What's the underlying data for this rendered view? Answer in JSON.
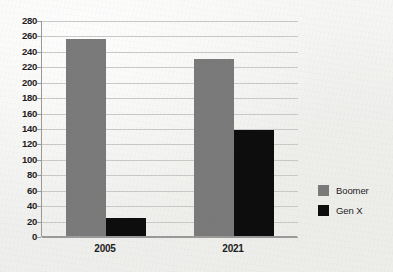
{
  "chart_data": {
    "type": "bar",
    "title": "",
    "subtitle": "",
    "xlabel": "",
    "ylabel": "",
    "categories": [
      "2005",
      "2021"
    ],
    "series": [
      {
        "name": "Boomer",
        "color": "#7a7a7a",
        "values": [
          255,
          230
        ]
      },
      {
        "name": "Gen X",
        "color": "#0d0d0d",
        "values": [
          24,
          138
        ]
      }
    ],
    "ylim": [
      0,
      280
    ],
    "ytick_step": 20,
    "ytick_labels": [
      "280",
      "260",
      "240",
      "220",
      "200",
      "180",
      "160",
      "140",
      "120",
      "100",
      "80",
      "60",
      "40",
      "20",
      "0"
    ],
    "grid": "horizontal",
    "legend_position": "right"
  },
  "legend": {
    "entries": [
      {
        "label": "Boomer",
        "color": "#7a7a7a"
      },
      {
        "label": "Gen X",
        "color": "#0d0d0d"
      }
    ]
  },
  "axis": {
    "line_color": "#9a9a9a",
    "grid_color": "#c9c9c7"
  },
  "background": {
    "color": "#f1f1ef"
  }
}
